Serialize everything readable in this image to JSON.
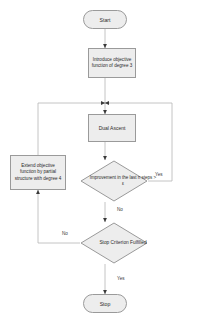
{
  "diagram": {
    "colors": {
      "node_fill": "#ededed",
      "node_border": "#9a9a9a",
      "line": "#b5b5b5",
      "text": "#2b2b2b"
    },
    "nodes": {
      "start": {
        "label": "Start",
        "shape": "terminator"
      },
      "introduce": {
        "label": "Introduce objective function of degree 3",
        "shape": "process"
      },
      "dual_ascent": {
        "label": "Dual Ascent",
        "shape": "process"
      },
      "improvement": {
        "label": "Improvement in the last n steps > ε",
        "shape": "decision"
      },
      "extend": {
        "label": "Extend objective function by partial structure with degree 4",
        "shape": "process"
      },
      "stop_criterion": {
        "label": "Stop Criterion Fulfilled",
        "shape": "decision"
      },
      "stop": {
        "label": "Stop",
        "shape": "terminator"
      }
    },
    "edge_labels": {
      "improvement_yes": "Yes",
      "improvement_no": "No",
      "stop_criterion_no": "No",
      "stop_criterion_yes": "Yes"
    }
  }
}
